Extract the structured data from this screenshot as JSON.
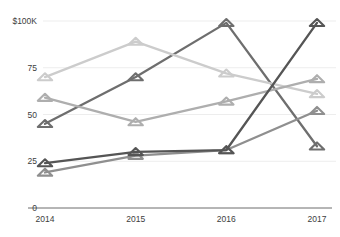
{
  "chart_data": {
    "type": "line",
    "title": "",
    "subtitle": "",
    "xlabel": "",
    "ylabel": "",
    "categories": [
      "2014",
      "2015",
      "2016",
      "2017"
    ],
    "x_tick_labels": [
      "2014",
      "2015",
      "2016",
      "2017"
    ],
    "y_tick_labels": [
      "0",
      "25",
      "50",
      "75",
      "$100K"
    ],
    "y_tick_values": [
      0,
      25,
      50,
      75,
      100
    ],
    "ylim": [
      0,
      100
    ],
    "grid": true,
    "grid_axis": "y",
    "legend": false,
    "legend_position": "none",
    "marker": "triangle",
    "series": [
      {
        "name": "series-1",
        "color": "#6e6e6e",
        "values": [
          45,
          70,
          99,
          33
        ]
      },
      {
        "name": "series-2",
        "color": "#8f8f8f",
        "values": [
          19,
          28,
          31,
          52
        ]
      },
      {
        "name": "series-3",
        "color": "#cccccc",
        "values": [
          70,
          89,
          72,
          61
        ]
      },
      {
        "name": "series-4",
        "color": "#aeaeae",
        "values": [
          59,
          46,
          57,
          69
        ]
      },
      {
        "name": "series-5",
        "color": "#555555",
        "values": [
          24,
          30,
          31,
          99
        ]
      }
    ]
  },
  "colors": {
    "axis_line": "#6d6d6d",
    "grid_line": "#ededed",
    "tick_text": "#3d3d3d",
    "background": "#ffffff"
  },
  "axis": {
    "y_top_label": "$100K",
    "y_labels": [
      "75",
      "50",
      "25",
      "0"
    ],
    "x_labels": [
      "2014",
      "2015",
      "2016",
      "2017"
    ]
  }
}
